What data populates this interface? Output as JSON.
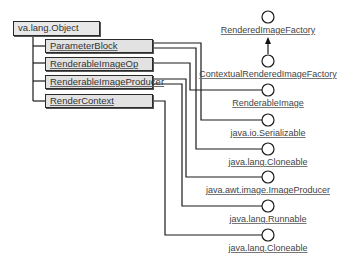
{
  "diagram": {
    "type": "UML class diagram",
    "root_class": {
      "label": "va.lang.Object"
    },
    "classes": [
      {
        "label": "ParameterBlock"
      },
      {
        "label": "RenderableImageOp"
      },
      {
        "label": "RenderableImageProducer"
      },
      {
        "label": "RenderContext"
      }
    ],
    "interfaces": [
      {
        "label": "RenderedImageFactory"
      },
      {
        "label": "ContextualRenderedImageFactory"
      },
      {
        "label": "RenderableImage"
      },
      {
        "label": "java.io.Serializable"
      },
      {
        "label": "java.lang.Cloneable"
      },
      {
        "label": "java.awt.image.ImageProducer"
      },
      {
        "label": "java.lang.Runnable"
      },
      {
        "label": "java.lang.Cloneable"
      }
    ],
    "relationships": [
      {
        "from": "ParameterBlock",
        "to": "java.lang.Object",
        "kind": "extends"
      },
      {
        "from": "RenderableImageOp",
        "to": "java.lang.Object",
        "kind": "extends"
      },
      {
        "from": "RenderableImageProducer",
        "to": "java.lang.Object",
        "kind": "extends"
      },
      {
        "from": "RenderContext",
        "to": "java.lang.Object",
        "kind": "extends"
      },
      {
        "from": "ContextualRenderedImageFactory",
        "to": "RenderedImageFactory",
        "kind": "extends"
      },
      {
        "from": "RenderableImageOp",
        "to": "RenderableImage",
        "kind": "implements"
      },
      {
        "from": "ParameterBlock",
        "to": "java.io.Serializable",
        "kind": "implements"
      },
      {
        "from": "ParameterBlock",
        "to": "java.lang.Cloneable",
        "kind": "implements"
      },
      {
        "from": "RenderableImageProducer",
        "to": "java.awt.image.ImageProducer",
        "kind": "implements"
      },
      {
        "from": "RenderableImageProducer",
        "to": "java.lang.Runnable",
        "kind": "implements"
      },
      {
        "from": "RenderContext",
        "to": "java.lang.Cloneable",
        "kind": "implements"
      }
    ]
  }
}
